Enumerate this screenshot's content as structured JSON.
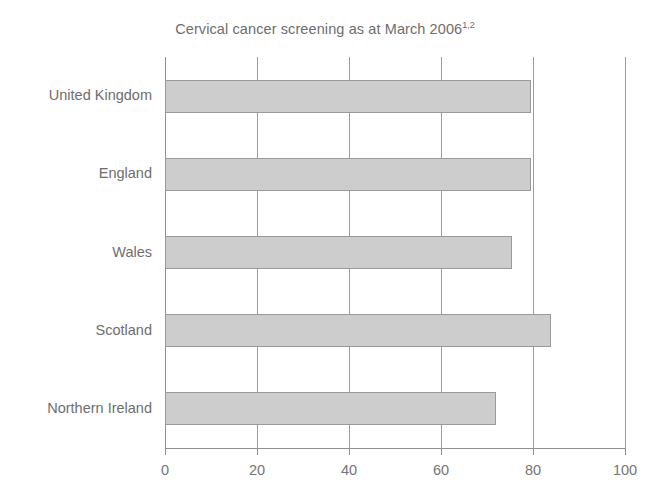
{
  "chart_data": {
    "type": "bar",
    "orientation": "horizontal",
    "title": "Cervical cancer screening as at March 2006",
    "title_superscript": "1,2",
    "xlabel": "",
    "ylabel": "",
    "categories": [
      "United Kingdom",
      "England",
      "Wales",
      "Scotland",
      "Northern Ireland"
    ],
    "values": [
      79.5,
      79.5,
      75.5,
      84,
      72
    ],
    "xlim": [
      0,
      100
    ],
    "xticks": [
      0,
      20,
      40,
      60,
      80,
      100
    ],
    "xtick_labels": [
      "0",
      "20",
      "40",
      "60",
      "80",
      "100"
    ],
    "grid": "vertical",
    "legend": "none",
    "bar_fill_color": "#cdcdcd",
    "bar_border_color": "#9a9a9a",
    "axis_color": "#8f8f8f",
    "gridline_color": "#9b9b9b",
    "text_color": "#6e6e6e"
  }
}
